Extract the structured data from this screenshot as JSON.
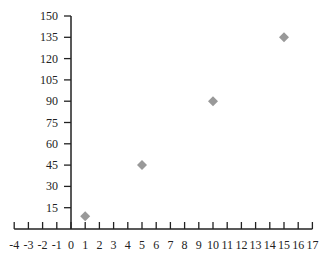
{
  "chart_data": {
    "type": "scatter",
    "title": "",
    "xlabel": "",
    "ylabel": "",
    "xlim": [
      -4,
      17
    ],
    "ylim": [
      0,
      150
    ],
    "x_ticks": [
      -4,
      -3,
      -2,
      -1,
      0,
      1,
      2,
      3,
      4,
      5,
      6,
      7,
      8,
      9,
      10,
      11,
      12,
      13,
      14,
      15,
      16,
      17
    ],
    "y_ticks": [
      15,
      30,
      45,
      60,
      75,
      90,
      105,
      120,
      135,
      150
    ],
    "grid": false,
    "legend": null,
    "marker": "diamond",
    "marker_color": "#999999",
    "axis_color": "#222222",
    "series": [
      {
        "name": "data",
        "x": [
          1,
          5,
          10,
          15
        ],
        "y": [
          9,
          45,
          90,
          135
        ]
      }
    ]
  }
}
